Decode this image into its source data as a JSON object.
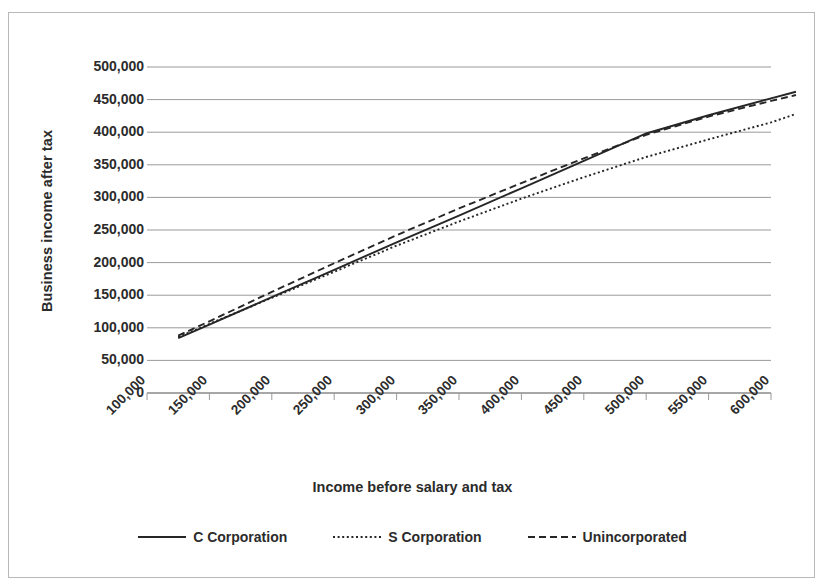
{
  "chart_data": {
    "type": "line",
    "title": "",
    "xlabel": "Income before salary and tax",
    "ylabel": "Business income after tax",
    "xlim": [
      100000,
      600000
    ],
    "ylim": [
      0,
      500000
    ],
    "grid": true,
    "legend_position": "bottom",
    "x_ticks": [
      "100,000",
      "150,000",
      "200,000",
      "250,000",
      "300,000",
      "350,000",
      "400,000",
      "450,000",
      "500,000",
      "550,000",
      "600,000"
    ],
    "y_ticks": [
      "0",
      "50,000",
      "100,000",
      "150,000",
      "200,000",
      "250,000",
      "300,000",
      "350,000",
      "400,000",
      "450,000",
      "500,000"
    ],
    "x": [
      125000,
      150000,
      200000,
      250000,
      300000,
      350000,
      400000,
      450000,
      500000,
      550000,
      600000,
      620000
    ],
    "series": [
      {
        "name": "C Corporation",
        "style": "solid",
        "color": "#262626",
        "values": [
          84000,
          105000,
          147000,
          189000,
          231000,
          272000,
          314000,
          356000,
          398000,
          426000,
          452000,
          462000
        ]
      },
      {
        "name": "S Corporation",
        "style": "dotted",
        "color": "#262626",
        "values": [
          86000,
          106000,
          146000,
          186000,
          226000,
          263000,
          298000,
          331000,
          362000,
          389000,
          415000,
          428000
        ]
      },
      {
        "name": "Unincorporated",
        "style": "dashed",
        "color": "#262626",
        "values": [
          88000,
          110000,
          155000,
          199000,
          242000,
          283000,
          322000,
          360000,
          396000,
          424000,
          448000,
          457000
        ]
      }
    ]
  },
  "legend": {
    "items": [
      {
        "label": "C Corporation"
      },
      {
        "label": "S Corporation"
      },
      {
        "label": "Unincorporated"
      }
    ]
  },
  "axes": {
    "y_title": "Business income after tax",
    "x_title": "Income before salary and tax"
  }
}
